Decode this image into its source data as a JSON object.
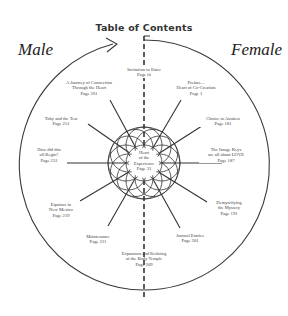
{
  "header": {
    "title": "Table of Contents",
    "left_label": "Male",
    "right_label": "Female"
  },
  "center": {
    "line1": "Heart",
    "line2": "of the",
    "line3": "Experience",
    "page": "Page 31"
  },
  "entries": [
    {
      "id": "invitation",
      "line1": "Invitation to Enter",
      "line2": "",
      "page": "Page iii"
    },
    {
      "id": "preface",
      "line1": "Preface...",
      "line2": "Heart of Co-Creation",
      "page": "Page 1"
    },
    {
      "id": "choice",
      "line1": "Choice to Awaken",
      "line2": "",
      "page": "Page 181"
    },
    {
      "id": "image-keys",
      "line1": "The Image Keys",
      "line2": "are all about LOVE",
      "page": "Page 187"
    },
    {
      "id": "demystifying",
      "line1": "Demystifying",
      "line2": "the Mystery",
      "page": "Page 191"
    },
    {
      "id": "journal",
      "line1": "Journal Entries",
      "line2": "",
      "page": "Page 201"
    },
    {
      "id": "expansion",
      "line1": "Expansion and Refining",
      "line2": "of the Body Temple",
      "page": "Page 209"
    },
    {
      "id": "maintenance",
      "line1": "Maintenance",
      "line2": "",
      "page": "Page 211"
    },
    {
      "id": "equinox",
      "line1": "Equinox in",
      "line2": "New Mexico",
      "page": "Page 219"
    },
    {
      "id": "how-begin",
      "line1": "How did this",
      "line2": "all Begin?",
      "page": "Page 231"
    },
    {
      "id": "toby",
      "line1": "Toby and the Test",
      "line2": "",
      "page": "Page 251"
    },
    {
      "id": "journey",
      "line1": "A Journey of Connection",
      "line2": "Through the Heart",
      "page": "Page 261"
    }
  ],
  "colors": {
    "ink": "#333333",
    "background": "#ffffff"
  }
}
